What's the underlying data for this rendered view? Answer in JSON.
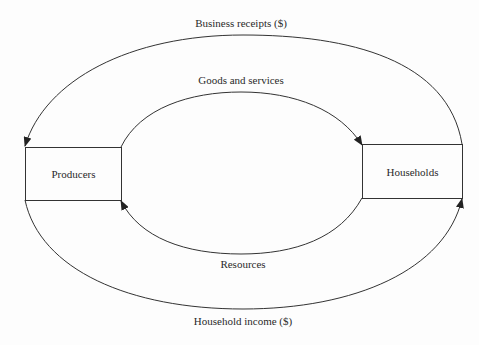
{
  "diagram": {
    "nodes": {
      "producers": "Producers",
      "households": "Households"
    },
    "flows": {
      "outer_top": "Business receipts ($)",
      "inner_top": "Goods and services",
      "inner_bottom": "Resources",
      "outer_bottom": "Household income ($)"
    },
    "edges": [
      {
        "from": "Households",
        "to": "Producers",
        "label": "Business receipts ($)",
        "path": "outer-top"
      },
      {
        "from": "Producers",
        "to": "Households",
        "label": "Goods and services",
        "path": "inner-top"
      },
      {
        "from": "Households",
        "to": "Producers",
        "label": "Resources",
        "path": "inner-bottom"
      },
      {
        "from": "Producers",
        "to": "Households",
        "label": "Household income ($)",
        "path": "outer-bottom"
      }
    ],
    "colors": {
      "line": "#333333",
      "background": "#fdfdfd",
      "text": "#2a2a2a"
    }
  }
}
